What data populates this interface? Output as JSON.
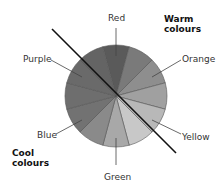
{
  "labels": {
    "red": "Red",
    "orange": "Orange",
    "yellow": "Yellow",
    "green": "Green",
    "blue": "Blue",
    "purple": "Purple",
    "warm_line1": "Warm",
    "warm_line2": "colours",
    "cool_line1": "Cool",
    "cool_line2": "colours"
  },
  "chart_data": {
    "type": "pie",
    "note": "Segment shades are visual estimates from the screenshot, not sampled pixel values.",
    "segments": [
      {
        "index": 0,
        "label": "Red",
        "shade": "#5a5a5a"
      },
      {
        "index": 1,
        "label": "",
        "shade": "#7a7a7a"
      },
      {
        "index": 2,
        "label": "",
        "shade": "#8e8e8e"
      },
      {
        "index": 3,
        "label": "Orange",
        "shade": "#a0a0a0"
      },
      {
        "index": 4,
        "label": "",
        "shade": "#b8b8b8"
      },
      {
        "index": 5,
        "label": "Yellow",
        "shade": "#c8c8c8"
      },
      {
        "index": 6,
        "label": "",
        "shade": "#a8a8a8"
      },
      {
        "index": 7,
        "label": "Green",
        "shade": "#8a8a8a"
      },
      {
        "index": 8,
        "label": "",
        "shade": "#727272"
      },
      {
        "index": 9,
        "label": "Blue",
        "shade": "#6e6e6e"
      },
      {
        "index": 10,
        "label": "",
        "shade": "#6a6a6a"
      },
      {
        "index": 11,
        "label": "Purple",
        "shade": "#646464"
      }
    ],
    "segment_count": 12,
    "divider": "diagonal line separating warm colours (top-right) from cool colours (bottom-left)",
    "groups": [
      {
        "name": "Warm colours",
        "side": "top-right"
      },
      {
        "name": "Cool colours",
        "side": "bottom-left"
      }
    ]
  }
}
